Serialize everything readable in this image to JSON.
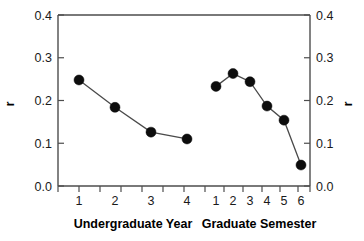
{
  "chart_data": {
    "type": "line",
    "title": "",
    "xlabel": "",
    "ylabel": "r",
    "ylim": [
      0.0,
      0.4
    ],
    "yticks": [
      "0.0",
      "0.1",
      "0.2",
      "0.3",
      "0.4"
    ],
    "ytick_values": [
      0.0,
      0.1,
      0.2,
      0.3,
      0.4
    ],
    "grid": false,
    "legend": "none",
    "right_axis": {
      "label": "r",
      "ticks": [
        "0.0",
        "0.1",
        "0.2",
        "0.3",
        "0.4"
      ]
    },
    "marker": "filled-circle",
    "marker_color": "#0d0d0d",
    "line_color": "#4a4a4a",
    "background_color": "#ffffff",
    "axis_color": "#4d4d4d",
    "series": [
      {
        "name": "Undergraduate Year",
        "categories": [
          "1",
          "2",
          "3",
          "4"
        ],
        "values": [
          0.248,
          0.184,
          0.126,
          0.11
        ]
      },
      {
        "name": "Graduate Semester",
        "categories": [
          "1",
          "2",
          "3",
          "4",
          "5",
          "6"
        ],
        "values": [
          0.233,
          0.263,
          0.244,
          0.187,
          0.154,
          0.049
        ]
      }
    ]
  },
  "axes": {
    "left": {
      "name": "r",
      "ticks": [
        {
          "label": "0.4",
          "value": 0.4
        },
        {
          "label": "0.3",
          "value": 0.3
        },
        {
          "label": "0.2",
          "value": 0.2
        },
        {
          "label": "0.1",
          "value": 0.1
        },
        {
          "label": "0.0",
          "value": 0.0
        }
      ]
    },
    "right": {
      "name": "r",
      "ticks": [
        {
          "label": "0.4",
          "value": 0.4
        },
        {
          "label": "0.3",
          "value": 0.3
        },
        {
          "label": "0.2",
          "value": 0.2
        },
        {
          "label": "0.1",
          "value": 0.1
        },
        {
          "label": "0.0",
          "value": 0.0
        }
      ]
    }
  },
  "groups": [
    {
      "title": "Undergraduate Year",
      "ticks": [
        "1",
        "2",
        "3",
        "4"
      ]
    },
    {
      "title": "Graduate Semester",
      "ticks": [
        "1",
        "2",
        "3",
        "4",
        "5",
        "6"
      ]
    }
  ]
}
